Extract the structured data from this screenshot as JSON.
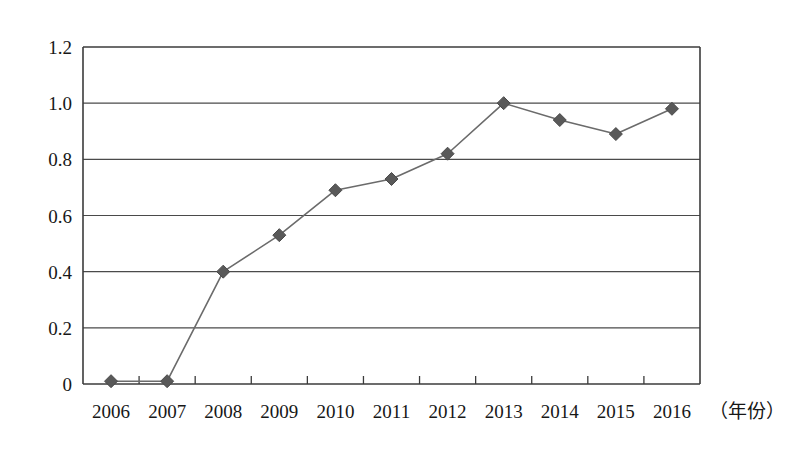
{
  "chart_data": {
    "type": "line",
    "title": "",
    "subtitle": "",
    "xlabel": "（年份）",
    "ylabel": "",
    "categories": [
      "2006",
      "2007",
      "2008",
      "2009",
      "2010",
      "2011",
      "2012",
      "2013",
      "2014",
      "2015",
      "2016"
    ],
    "series": [
      {
        "name": "series-1",
        "values": [
          0.01,
          0.01,
          0.4,
          0.53,
          0.69,
          0.73,
          0.82,
          1.0,
          0.94,
          0.89,
          0.98
        ]
      }
    ],
    "ylim": [
      0,
      1.2
    ],
    "y_ticks": [
      "0",
      "0.2",
      "0.4",
      "0.6",
      "0.8",
      "1.0",
      "1.2"
    ],
    "y_tick_values": [
      0,
      0.2,
      0.4,
      0.6,
      0.8,
      1.0,
      1.2
    ],
    "grid": "horizontal",
    "legend": "none",
    "marker": "diamond",
    "colors": {
      "line": "#6b6b6b",
      "marker": "#595959",
      "axis": "#3b3b3b",
      "grid": "#4a4a4a",
      "text": "#171717",
      "background": "#ffffff"
    }
  }
}
